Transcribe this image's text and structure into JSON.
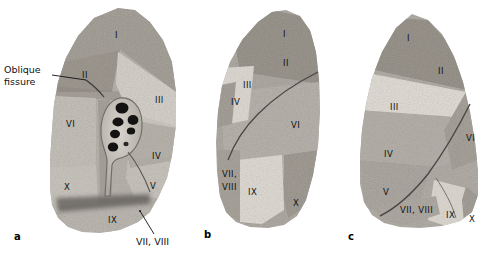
{
  "figure": {
    "background_color": "#ffffff",
    "label_color": "#111111",
    "panels": [
      {
        "letter": "a",
        "letter_x": 14,
        "letter_y": 231,
        "view": "medial surface with hilum",
        "segment_labels": [
          {
            "text": "I",
            "x": 115,
            "y": 30
          },
          {
            "text": "II",
            "x": 82,
            "y": 70
          },
          {
            "text": "III",
            "x": 155,
            "y": 95
          },
          {
            "text": "VI",
            "x": 66,
            "y": 119
          },
          {
            "text": "IV",
            "x": 152,
            "y": 151
          },
          {
            "text": "V",
            "x": 150,
            "y": 181
          },
          {
            "text": "X",
            "x": 64,
            "y": 182
          },
          {
            "text": "IX",
            "x": 108,
            "y": 215
          }
        ]
      },
      {
        "letter": "b",
        "letter_x": 204,
        "letter_y": 229,
        "view": "anterior surface",
        "segment_labels": [
          {
            "text": "I",
            "x": 283,
            "y": 29
          },
          {
            "text": "II",
            "x": 283,
            "y": 58
          },
          {
            "text": "III",
            "x": 243,
            "y": 80
          },
          {
            "text": "IV",
            "x": 231,
            "y": 97
          },
          {
            "text": "VI",
            "x": 291,
            "y": 120
          },
          {
            "text": "VII,",
            "x": 222,
            "y": 169
          },
          {
            "text": "VIII",
            "x": 222,
            "y": 182
          },
          {
            "text": "IX",
            "x": 248,
            "y": 187
          },
          {
            "text": "X",
            "x": 293,
            "y": 198
          }
        ]
      },
      {
        "letter": "c",
        "letter_x": 348,
        "letter_y": 231,
        "view": "lateral surface",
        "segment_labels": [
          {
            "text": "I",
            "x": 407,
            "y": 33
          },
          {
            "text": "II",
            "x": 438,
            "y": 66
          },
          {
            "text": "III",
            "x": 390,
            "y": 102
          },
          {
            "text": "VI",
            "x": 466,
            "y": 133
          },
          {
            "text": "IV",
            "x": 384,
            "y": 149
          },
          {
            "text": "V",
            "x": 383,
            "y": 187
          },
          {
            "text": "VII, VIII",
            "x": 400,
            "y": 205
          },
          {
            "text": "IX",
            "x": 446,
            "y": 210
          },
          {
            "text": "X",
            "x": 469,
            "y": 214
          }
        ]
      }
    ],
    "callouts": [
      {
        "name": "oblique-fissure",
        "text": "Oblique\nfissure",
        "x": 4,
        "y": 64,
        "leader": {
          "x1": 52,
          "y1": 75,
          "x2": 86,
          "y2": 80
        }
      },
      {
        "name": "segments-vii-viii",
        "text": "VII, VIII",
        "x": 136,
        "y": 236,
        "leader": {
          "x1": 154,
          "y1": 234,
          "x2": 140,
          "y2": 211
        }
      }
    ]
  }
}
